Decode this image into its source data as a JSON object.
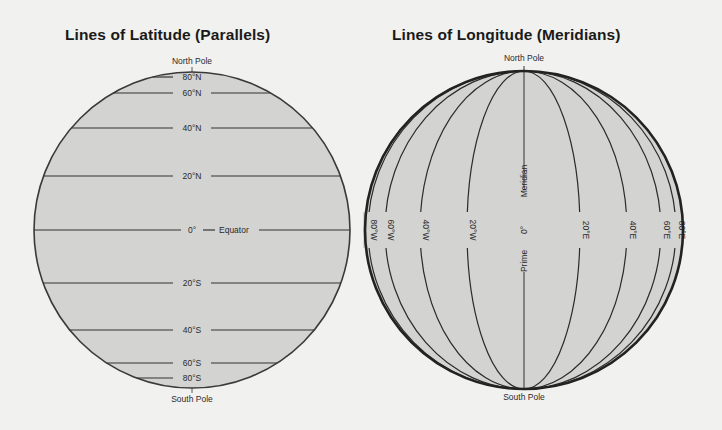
{
  "latitude_panel": {
    "title": "Lines of Latitude (Parallels)",
    "north_label": "North Pole",
    "south_label": "South Pole",
    "equator_label": "Equator",
    "lines": [
      {
        "label": "80°N",
        "y": 77
      },
      {
        "label": "60°N",
        "y": 93
      },
      {
        "label": "40°N",
        "y": 128
      },
      {
        "label": "20°N",
        "y": 176
      },
      {
        "label": "0°",
        "y": 230
      },
      {
        "label": "20°S",
        "y": 283
      },
      {
        "label": "40°S",
        "y": 330
      },
      {
        "label": "60°S",
        "y": 363
      },
      {
        "label": "80°S",
        "y": 378
      }
    ]
  },
  "longitude_panel": {
    "title": "Lines of Longitude (Meridians)",
    "north_label": "North Pole",
    "south_label": "South Pole",
    "prime_meridian_label_top": "Meridian",
    "prime_meridian_label_bottom": "Prime",
    "prime_meridian_degree": "0°",
    "meridians": [
      {
        "label": "80°W",
        "x": 368
      },
      {
        "label": "60°W",
        "x": 385
      },
      {
        "label": "40°W",
        "x": 420
      },
      {
        "label": "20°W",
        "x": 467
      },
      {
        "label": "20°E",
        "x": 580
      },
      {
        "label": "40°E",
        "x": 627
      },
      {
        "label": "60°E",
        "x": 661
      },
      {
        "label": "80°E",
        "x": 676
      }
    ]
  },
  "colors": {
    "background": "#f1f1ef",
    "globe_fill": "#d3d3d1",
    "line": "#2b2b2b"
  }
}
